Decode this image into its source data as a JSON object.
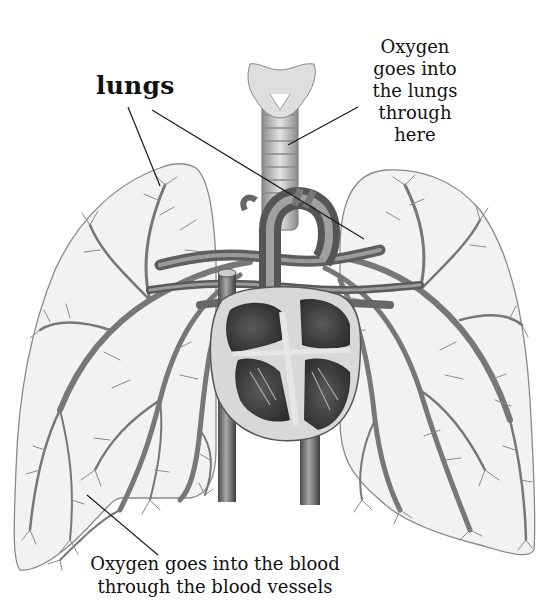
{
  "diagram": {
    "labels": {
      "lungs": "lungs",
      "trachea": "Oxygen\ngoes into\nthe lungs\nthrough\nhere",
      "blood_vessels": "Oxygen goes into the blood\nthrough the blood vessels"
    },
    "parts": [
      "larynx",
      "trachea",
      "left-lung",
      "right-lung",
      "heart",
      "aorta",
      "pulmonary-arteries",
      "vena-cava",
      "bronchial-vessels"
    ],
    "colors": {
      "lung_fill": "#f1f1f1",
      "lung_outline": "#8a8a8a",
      "vessel": "#6e6e6e",
      "heart_dark": "#3c3c3c",
      "heart_mid": "#8c8c8c",
      "pointer_line": "#1a1a1a"
    }
  }
}
